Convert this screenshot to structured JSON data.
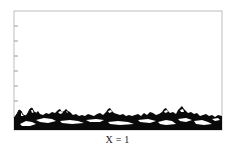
{
  "figure": {
    "label": "X = 1",
    "frame": {
      "left": 14,
      "top": 11,
      "right": 222,
      "bottom": 130,
      "color": "#bdbdbd"
    },
    "y_ticks": [
      26,
      41,
      56,
      71,
      86,
      101
    ],
    "deposit": {
      "fill": "#0a0a0a",
      "hole_fill": "#ffffff",
      "baseline_y": 130,
      "mean_top_y": 114
    }
  }
}
